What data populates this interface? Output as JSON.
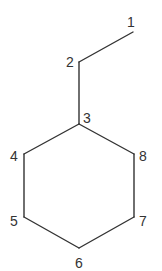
{
  "diagram": {
    "type": "skeletal-structure",
    "atoms": [
      {
        "id": "1",
        "label": "1",
        "x": 133,
        "y": 32,
        "lx": 127,
        "ly": 27
      },
      {
        "id": "2",
        "label": "2",
        "x": 79,
        "y": 62,
        "lx": 66,
        "ly": 67
      },
      {
        "id": "3",
        "label": "3",
        "x": 79,
        "y": 124,
        "lx": 83,
        "ly": 123
      },
      {
        "id": "4",
        "label": "4",
        "x": 24,
        "y": 154,
        "lx": 10,
        "ly": 161
      },
      {
        "id": "5",
        "label": "5",
        "x": 24,
        "y": 217,
        "lx": 10,
        "ly": 226
      },
      {
        "id": "6",
        "label": "6",
        "x": 79,
        "y": 248,
        "lx": 75,
        "ly": 268
      },
      {
        "id": "7",
        "label": "7",
        "x": 134,
        "y": 217,
        "lx": 139,
        "ly": 226
      },
      {
        "id": "8",
        "label": "8",
        "x": 134,
        "y": 154,
        "lx": 139,
        "ly": 161
      }
    ],
    "bonds": [
      [
        "1",
        "2"
      ],
      [
        "2",
        "3"
      ],
      [
        "3",
        "4"
      ],
      [
        "4",
        "5"
      ],
      [
        "5",
        "6"
      ],
      [
        "6",
        "7"
      ],
      [
        "7",
        "8"
      ],
      [
        "8",
        "3"
      ]
    ],
    "colors": {
      "line": "#333333",
      "text": "#333333",
      "background": "#ffffff"
    }
  }
}
